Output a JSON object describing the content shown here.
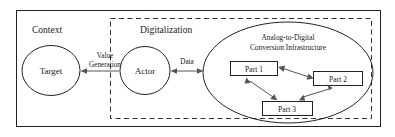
{
  "diagram": {
    "title_visible": false,
    "sections": [
      {
        "id": "context",
        "label": "Context",
        "border": "solid"
      },
      {
        "id": "digitalization",
        "label": "Digitalization",
        "border": "dashed"
      }
    ],
    "nodes": [
      {
        "id": "target",
        "label": "Target",
        "shape": "ellipse"
      },
      {
        "id": "actor",
        "label": "Actor",
        "shape": "ellipse"
      },
      {
        "id": "infrastructure",
        "label_line1": "Analog-to-Digital",
        "label_line2": "Conversion Infrastructure",
        "shape": "ellipse"
      },
      {
        "id": "part1",
        "label": "Part 1",
        "shape": "rectangle"
      },
      {
        "id": "part2",
        "label": "Part 2",
        "shape": "rectangle"
      },
      {
        "id": "part3",
        "label": "Part 3",
        "shape": "rectangle"
      }
    ],
    "edges": [
      {
        "id": "value-generation",
        "label_line1": "Value",
        "label_line2": "Generation",
        "from": "actor",
        "to": "target",
        "direction": "single"
      },
      {
        "id": "data",
        "label": "Data",
        "from": "actor",
        "to": "infrastructure",
        "direction": "double"
      },
      {
        "id": "part1-part2",
        "label": "",
        "from": "part1",
        "to": "part2",
        "direction": "double"
      },
      {
        "id": "part1-part3",
        "label": "",
        "from": "part1",
        "to": "part3",
        "direction": "double"
      },
      {
        "id": "part2-part3",
        "label": "",
        "from": "part2",
        "to": "part3",
        "direction": "double"
      }
    ],
    "colors": {
      "stroke": "#222222",
      "connector": "#555555",
      "text": "#1a1a1a",
      "background": "#ffffff"
    }
  }
}
